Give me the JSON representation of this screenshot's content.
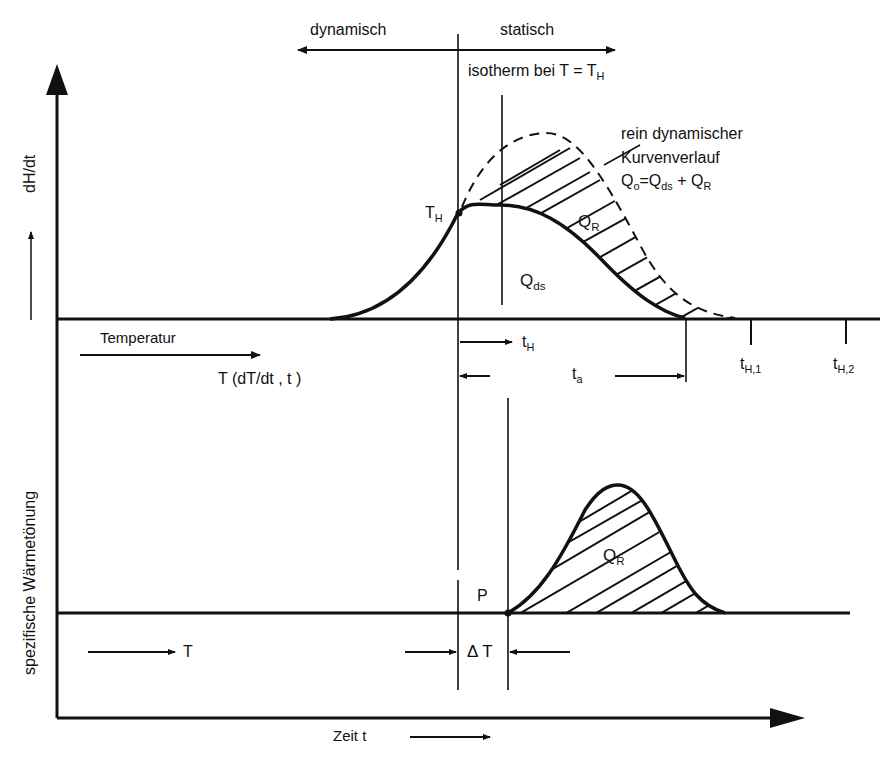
{
  "diagram": {
    "type": "technical-diagram",
    "colors": {
      "ink": "#111111",
      "background": "#ffffff"
    }
  },
  "top_arrow": {
    "left_label": "dynamisch",
    "right_label": "statisch"
  },
  "isotherm_label": {
    "text": "isotherm bei  T = T",
    "sub": "H"
  },
  "y_axis": {
    "label_part1": "spezifische  Wärmetönung",
    "label_arrow": "⟶",
    "label_part2": "dH/dt"
  },
  "x_axis": {
    "label": "Zeit  t",
    "arrow": "⟶"
  },
  "upper_plot": {
    "point_label": {
      "main": "T",
      "sub": "H"
    },
    "region_static": {
      "main": "Q",
      "sub": "ds"
    },
    "region_reaction": {
      "main": "Q",
      "sub": "R"
    },
    "annotation": {
      "line1": "rein  dynamischer",
      "line2": "Kurvenverlauf",
      "formula_main": "Q",
      "formula_sub0": "o",
      "formula_eq": "=Q",
      "formula_sub1": "ds",
      "formula_plus": " + Q",
      "formula_sub2": "R"
    },
    "temperature_label": "Temperatur",
    "temperature_func": "T (dT/dt , t )",
    "time_marks": [
      {
        "main": "t",
        "sub": "H"
      },
      {
        "main": "t",
        "sub": "a"
      },
      {
        "main": "t",
        "sub": "H,1"
      },
      {
        "main": "t",
        "sub": "H,2"
      }
    ]
  },
  "lower_plot": {
    "region_reaction": {
      "main": "Q",
      "sub": "R"
    },
    "point_label": "P",
    "delta_label": "Δ T",
    "temperature_label": "T"
  }
}
